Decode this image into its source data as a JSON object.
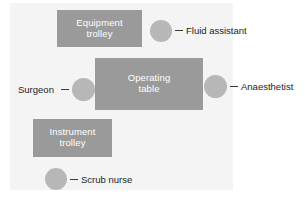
{
  "diagram": {
    "background_color": "#f4f4f4",
    "box_color": "#9a9a9a",
    "box_text_color": "#ffffff",
    "circle_color": "#b7b7b7",
    "label_text_color": "#1c1c1c",
    "boxes": [
      {
        "id": "equipment-trolley",
        "line1": "Equipment",
        "line2": "trolley"
      },
      {
        "id": "operating-table",
        "line1": "Operating",
        "line2": "table"
      },
      {
        "id": "instrument-trolley",
        "line1": "Instrument",
        "line2": "trolley"
      }
    ],
    "people": [
      {
        "id": "fluid-assistant",
        "label": "Fluid assistant"
      },
      {
        "id": "surgeon",
        "label": "Surgeon"
      },
      {
        "id": "anaesthetist",
        "label": "Anaesthetist"
      },
      {
        "id": "scrub-nurse",
        "label": "Scrub nurse"
      }
    ]
  }
}
